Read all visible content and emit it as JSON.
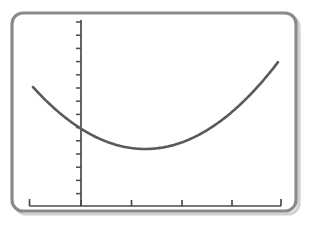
{
  "figure": {
    "frame": {
      "name": "rounded-border-frame",
      "x": 12.0,
      "y": 13.0,
      "width": 284.0,
      "height": 198.0,
      "radius": 11,
      "stroke": "#8a8a8a",
      "stroke_width": 3.2,
      "fill": "#ffffff",
      "shadow_color": "#c9c9c9"
    },
    "background": "#ffffff",
    "ink_color": "#4a4a4a",
    "curve_color": "#5a5a5a"
  },
  "chart_data": {
    "type": "line",
    "title": "",
    "subtitle": "",
    "xlabel": "",
    "ylabel": "",
    "shape": "parabola",
    "opens": "up",
    "grid": false,
    "legend": null,
    "legend_position": "none",
    "axis_labels_shown": false,
    "tick_labels_shown": false,
    "xlim": [
      -2.0,
      10.0
    ],
    "ylim": [
      0.0,
      14.0
    ],
    "vertex": {
      "x": 3.6,
      "y": 2.75
    },
    "y_intercept": {
      "x": 0.0,
      "y": 4.5
    },
    "equation": "y = 0.135 (x - 3.6)^2 + 2.75",
    "x": [
      -1.3,
      -0.9,
      -0.5,
      0.0,
      0.5,
      1.0,
      1.5,
      2.0,
      2.5,
      3.0,
      3.6,
      4.2,
      4.8,
      5.4,
      6.0,
      6.6,
      7.2,
      7.8,
      8.4,
      9.0,
      9.4
    ],
    "y": [
      6.62,
      6.04,
      5.5,
      4.5,
      4.31,
      3.85,
      3.44,
      3.1,
      2.91,
      2.79,
      2.75,
      2.79,
      2.95,
      3.19,
      3.53,
      3.96,
      4.48,
      5.09,
      5.8,
      5.9,
      6.6
    ],
    "axes": {
      "x_axis": {
        "name": "x-axis",
        "drawn_from_px": {
          "x": 29.5,
          "y": 206.0
        },
        "drawn_to_px": {
          "x": 281.0,
          "y": 206.0
        },
        "tick_direction": "up",
        "end_tick_height_px": 7,
        "interior_tick_height_px": 6,
        "ticks_px": [
          29.5,
          81.0,
          131.5,
          182.0,
          232.0,
          281.0
        ],
        "tick_count": 6
      },
      "y_axis": {
        "name": "y-axis",
        "drawn_from_px": {
          "x": 81.0,
          "y": 20.0
        },
        "drawn_to_px": {
          "x": 81.0,
          "y": 206.0
        },
        "tick_direction": "left",
        "tick_length_px": 5,
        "tick_count": 14,
        "first_tick_y_px": 22.0,
        "tick_spacing_px": 13.2
      }
    },
    "curve_px": {
      "start": {
        "x": 33.0,
        "y": 75.0
      },
      "vertex": {
        "x": 157.0,
        "y": 149.0
      },
      "end": {
        "x": 278.0,
        "y": 75.0
      },
      "y_axis_crossing": {
        "x": 81.0,
        "y": 122.0
      },
      "stroke_width": 2.6
    }
  }
}
